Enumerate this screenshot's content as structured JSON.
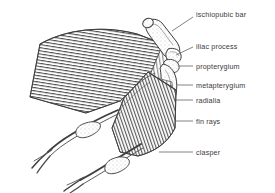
{
  "figure": {
    "type": "anatomical-line-drawing",
    "background_color": "#ffffff",
    "ink_color": "#3b3b3b",
    "line_color": "#555555",
    "width": 275,
    "height": 193
  },
  "labels": [
    {
      "id": "ischiopubic-bar",
      "text": "ischiopubic bar",
      "x": 196,
      "y": 11,
      "leader": {
        "x1": 193,
        "y1": 17,
        "x2": 172,
        "y2": 31
      }
    },
    {
      "id": "iliac-process",
      "text": "iliac process",
      "x": 196,
      "y": 43,
      "leader": {
        "x1": 193,
        "y1": 47,
        "x2": 176,
        "y2": 55
      }
    },
    {
      "id": "propterygium",
      "text": "propterygium",
      "x": 196,
      "y": 63,
      "leader": {
        "x1": 193,
        "y1": 66,
        "x2": 179,
        "y2": 66
      }
    },
    {
      "id": "metapterygium",
      "text": "metapterygium",
      "x": 196,
      "y": 82,
      "leader": {
        "x1": 193,
        "y1": 85,
        "x2": 177,
        "y2": 85
      }
    },
    {
      "id": "radialia",
      "text": "radialia",
      "x": 196,
      "y": 97,
      "leader": {
        "x1": 193,
        "y1": 100,
        "x2": 176,
        "y2": 100
      }
    },
    {
      "id": "fin-rays",
      "text": "fin rays",
      "x": 196,
      "y": 118,
      "leader": {
        "x1": 193,
        "y1": 121,
        "x2": 176,
        "y2": 121
      }
    },
    {
      "id": "clasper",
      "text": "clasper",
      "x": 196,
      "y": 149,
      "leader": {
        "x1": 193,
        "y1": 152,
        "x2": 159,
        "y2": 152
      }
    }
  ]
}
